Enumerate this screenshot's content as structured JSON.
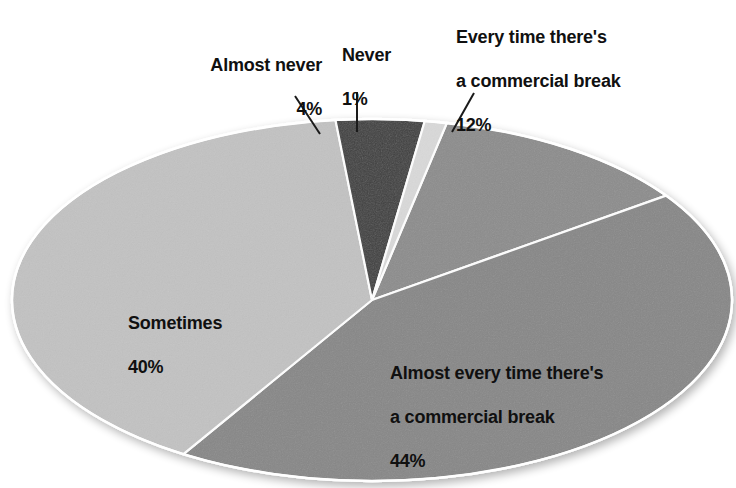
{
  "chart_data": {
    "type": "pie",
    "title": "",
    "subtitle": "",
    "xlabel": "",
    "ylabel": "",
    "legend_position": "none",
    "grid": false,
    "units": "percent",
    "start_angle_deg": 12,
    "direction": "clockwise",
    "categories": [
      "Every time there's a commercial break",
      "Almost every time there's a commercial break",
      "Sometimes",
      "Almost never",
      "Never"
    ],
    "values": [
      12,
      44,
      40,
      4,
      1
    ],
    "slice_colors": [
      "#8c8c8c",
      "#878787",
      "#c2c2c2",
      "#3f3f3f",
      "#d9d9d9"
    ],
    "slice_separator_color": "#ffffff",
    "slices": [
      {
        "name": "every-time",
        "label": "Every time there's\na commercial break",
        "value": 12,
        "value_label": "12%",
        "color": "#8c8c8c",
        "label_color": "#101010",
        "label_placement": "outside-callout"
      },
      {
        "name": "almost-every-time",
        "label": "Almost every time there's\na commercial break",
        "value": 44,
        "value_label": "44%",
        "color": "#878787",
        "label_color": "#101010",
        "label_placement": "inside"
      },
      {
        "name": "sometimes",
        "label": "Sometimes",
        "value": 40,
        "value_label": "40%",
        "color": "#c2c2c2",
        "label_color": "#101010",
        "label_placement": "inside"
      },
      {
        "name": "almost-never",
        "label": "Almost never",
        "value": 4,
        "value_label": "4%",
        "color": "#3f3f3f",
        "label_color": "#101010",
        "label_placement": "outside-callout"
      },
      {
        "name": "never",
        "label": "Never",
        "value": 1,
        "value_label": "1%",
        "color": "#d9d9d9",
        "label_color": "#101010",
        "label_placement": "outside-callout"
      }
    ]
  },
  "labels": {
    "almost_never": {
      "text": "Almost never",
      "value": "4%"
    },
    "never": {
      "text": "Never",
      "value": "1%"
    },
    "every_time": {
      "line1": "Every time there's",
      "line2": "a commercial break",
      "value": "12%"
    },
    "sometimes": {
      "text": "Sometimes",
      "value": "40%"
    },
    "almost_every_time": {
      "line1": "Almost every time there's",
      "line2": "a commercial break",
      "value": "44%"
    }
  },
  "colors": {
    "background": "#ffffff",
    "text": "#101010",
    "leader_line": "#1a1a1a",
    "slice_edge": "#ffffff"
  }
}
